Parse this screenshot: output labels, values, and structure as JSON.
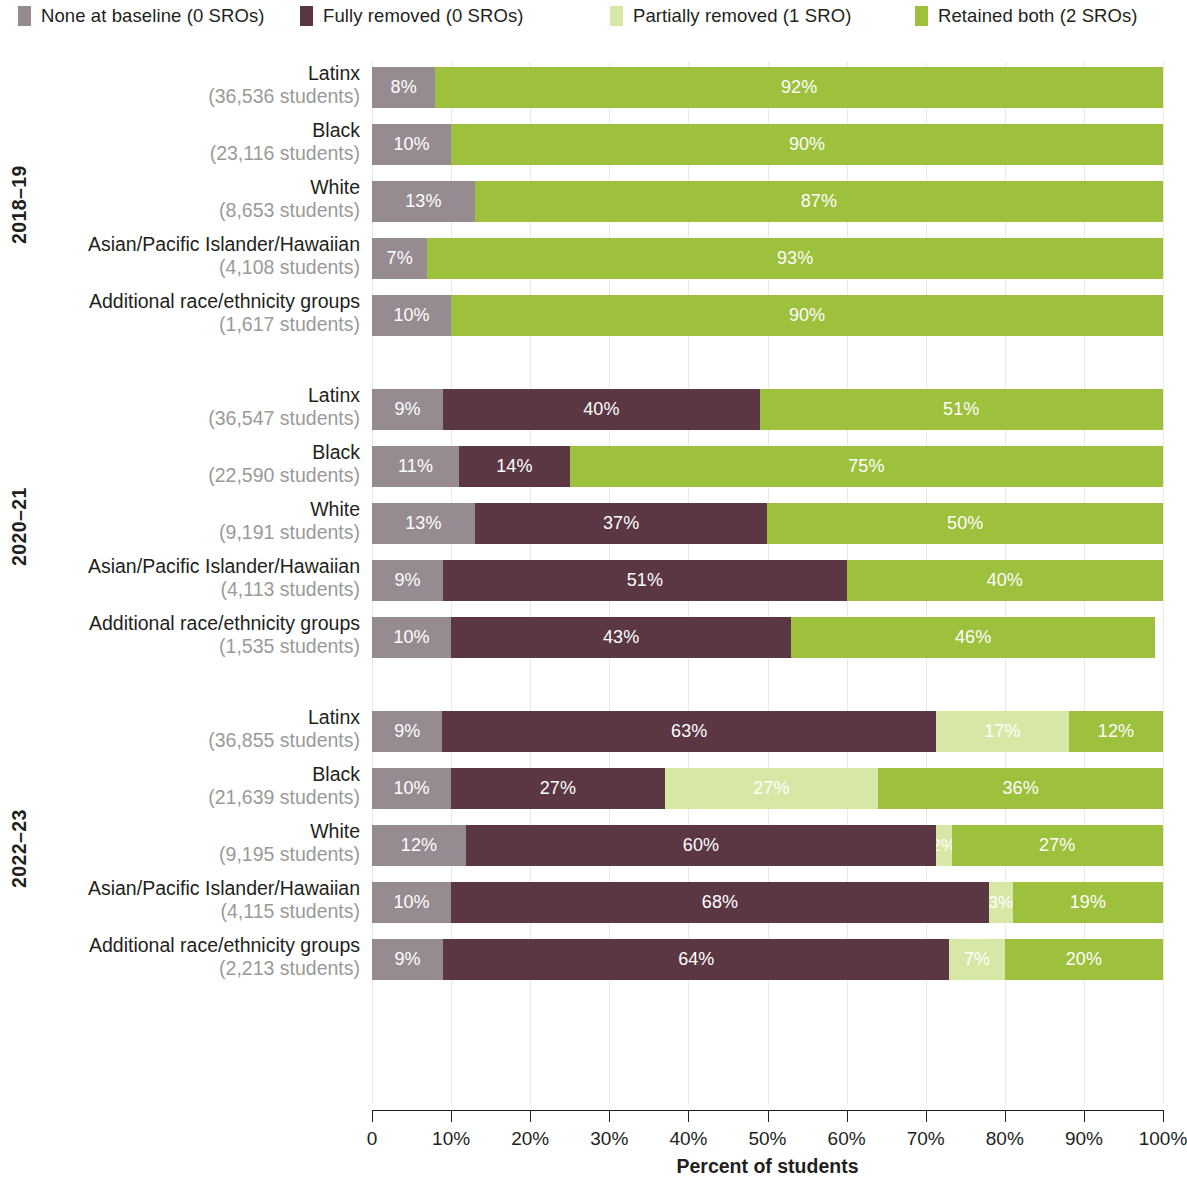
{
  "colors": {
    "none_at_baseline": "#968b90",
    "fully_removed": "#5a3742",
    "partially_removed": "#d7e8a6",
    "retained_both": "#9dc13c",
    "axis": "#231f20",
    "grid": "#e8e8e6",
    "subtext": "#9a9a98"
  },
  "legend": {
    "items": [
      {
        "label": "None at baseline (0 SROs)",
        "color_key": "none_at_baseline",
        "left": 18
      },
      {
        "label": "Fully removed (0 SROs)",
        "color_key": "fully_removed",
        "left": 300
      },
      {
        "label": "Partially removed (1 SRO)",
        "color_key": "partially_removed",
        "left": 610
      },
      {
        "label": "Retained both (2 SROs)",
        "color_key": "retained_both",
        "left": 915
      }
    ]
  },
  "axis": {
    "title": "Percent of students",
    "ticks": [
      "0",
      "10%",
      "20%",
      "30%",
      "40%",
      "50%",
      "60%",
      "70%",
      "80%",
      "90%",
      "100%"
    ]
  },
  "chart_data": {
    "type": "bar",
    "subtype": "horizontal stacked 100%",
    "title": "",
    "xlabel": "Percent of students",
    "ylabel": "",
    "xlim": [
      0,
      100
    ],
    "grid": true,
    "legend_position": "top",
    "series": [
      {
        "name": "None at baseline (0 SROs)",
        "color": "#968b90"
      },
      {
        "name": "Fully removed (0 SROs)",
        "color": "#5a3742"
      },
      {
        "name": "Partially removed (1 SRO)",
        "color": "#d7e8a6"
      },
      {
        "name": "Retained both (2 SROs)",
        "color": "#9dc13c"
      }
    ],
    "groups": [
      {
        "year": "2018–19",
        "rows": [
          {
            "name": "Latinx",
            "sub": "(36,536 students)",
            "values": [
              8,
              0,
              0,
              92
            ],
            "labels": [
              "8%",
              "",
              "",
              "92%"
            ]
          },
          {
            "name": "Black",
            "sub": "(23,116 students)",
            "values": [
              10,
              0,
              0,
              90
            ],
            "labels": [
              "10%",
              "",
              "",
              "90%"
            ]
          },
          {
            "name": "White",
            "sub": "(8,653 students)",
            "values": [
              13,
              0,
              0,
              87
            ],
            "labels": [
              "13%",
              "",
              "",
              "87%"
            ]
          },
          {
            "name": "Asian/Pacific Islander/Hawaiian",
            "sub": "(4,108 students)",
            "values": [
              7,
              0,
              0,
              93
            ],
            "labels": [
              "7%",
              "",
              "",
              "93%"
            ]
          },
          {
            "name": "Additional race/ethnicity groups",
            "sub": "(1,617 students)",
            "values": [
              10,
              0,
              0,
              90
            ],
            "labels": [
              "10%",
              "",
              "",
              "90%"
            ]
          }
        ]
      },
      {
        "year": "2020–21",
        "rows": [
          {
            "name": "Latinx",
            "sub": "(36,547 students)",
            "values": [
              9,
              40,
              0,
              51
            ],
            "labels": [
              "9%",
              "40%",
              "",
              "51%"
            ]
          },
          {
            "name": "Black",
            "sub": "(22,590 students)",
            "values": [
              11,
              14,
              0,
              75
            ],
            "labels": [
              "11%",
              "14%",
              "",
              "75%"
            ]
          },
          {
            "name": "White",
            "sub": "(9,191 students)",
            "values": [
              13,
              37,
              0,
              50
            ],
            "labels": [
              "13%",
              "37%",
              "",
              "50%"
            ]
          },
          {
            "name": "Asian/Pacific Islander/Hawaiian",
            "sub": "(4,113 students)",
            "values": [
              9,
              51,
              0,
              40
            ],
            "labels": [
              "9%",
              "51%",
              "",
              "40%"
            ]
          },
          {
            "name": "Additional race/ethnicity groups",
            "sub": "(1,535 students)",
            "values": [
              10,
              43,
              0,
              46
            ],
            "labels": [
              "10%",
              "43%",
              "",
              "46%"
            ]
          }
        ]
      },
      {
        "year": "2022–23",
        "rows": [
          {
            "name": "Latinx",
            "sub": "(36,855 students)",
            "values": [
              9,
              63,
              17,
              12
            ],
            "labels": [
              "9%",
              "63%",
              "17%",
              "12%"
            ]
          },
          {
            "name": "Black",
            "sub": "(21,639 students)",
            "values": [
              10,
              27,
              27,
              36
            ],
            "labels": [
              "10%",
              "27%",
              "27%",
              "36%"
            ]
          },
          {
            "name": "White",
            "sub": "(9,195 students)",
            "values": [
              12,
              60,
              2,
              27
            ],
            "labels": [
              "12%",
              "60%",
              "2%",
              "27%"
            ]
          },
          {
            "name": "Asian/Pacific Islander/Hawaiian",
            "sub": "(4,115 students)",
            "values": [
              10,
              68,
              3,
              19
            ],
            "labels": [
              "10%",
              "68%",
              "3%",
              "19%"
            ]
          },
          {
            "name": "Additional race/ethnicity groups",
            "sub": "(2,213 students)",
            "values": [
              9,
              64,
              7,
              20
            ],
            "labels": [
              "9%",
              "64%",
              "7%",
              "20%"
            ]
          }
        ]
      }
    ]
  }
}
